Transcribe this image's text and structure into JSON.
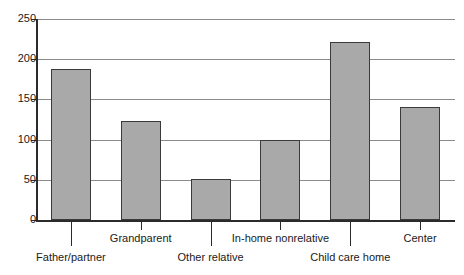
{
  "chart_data": {
    "type": "bar",
    "title": "",
    "subtitle": "",
    "xlabel": "",
    "ylabel": "",
    "categories": [
      "Father/partner",
      "Grandparent",
      "Other relative",
      "In-home nonrelative",
      "Child care home",
      "Center"
    ],
    "values": [
      188,
      123,
      51,
      100,
      221,
      141
    ],
    "ylim": [
      0,
      250
    ],
    "yticks": [
      0,
      50,
      100,
      150,
      200,
      250
    ],
    "ytick_labels": [
      "0",
      "50",
      "100",
      "150",
      "200",
      "250"
    ],
    "grid": "horizontal",
    "legend": "none",
    "bar_color": "#a9a9a9",
    "bar_edge_color": "#3a3a3a",
    "gridline_color": "#8c8c8c",
    "axis_color": "#2b2b2b"
  },
  "axis": {
    "y_title_partial": "",
    "label_rows": [
      0,
      1,
      0,
      1,
      0,
      1
    ]
  }
}
